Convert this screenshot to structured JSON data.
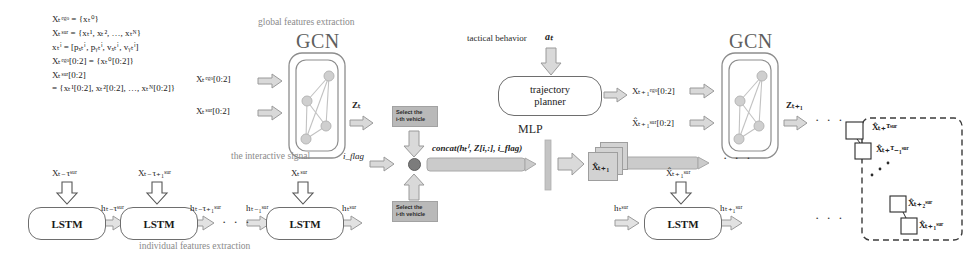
{
  "figure": {
    "type": "neural-network-architecture-diagram"
  },
  "equations": {
    "line1": "Xₜᵉᵍᵒ = {xₜ⁰}",
    "line2": "Xₜˢᵘʳ = {xₜ¹, xₜ², …, xₜᴺ}",
    "line3": "xₜⁱ = [pₓₜⁱ, pᵧₜⁱ, vₓₜⁱ, vᵧₜⁱ]",
    "line4": "Xₜᵉᵍᵒ[0:2] = {xₜ⁰[0:2]}",
    "line5": "Xₜˢᵘʳ[0:2]",
    "line6": "= {xₜ¹[0:2], xₜ²[0:2], …, xₜᴺ[0:2]}"
  },
  "labels": {
    "global_features": "global features extraction",
    "individual_features": "individual features extraction",
    "interactive_signal": "the interactive signal",
    "tactical_behavior": "tactical behavior",
    "gcn_left": "GCN",
    "gcn_right": "GCN",
    "mlp": "MLP",
    "planner_line1": "trajectory",
    "planner_line2": "planner",
    "lstm": "LSTM",
    "select_line1": "Select the",
    "select_line2": "i-th vehicle",
    "ellipsis": "· · ·"
  },
  "symbols": {
    "input_ego_slice": "Xₜᵉᵍᵒ[0:2]",
    "input_sur_slice": "Xₜˢᵘʳ[0:2]",
    "z_t": "Zₜ",
    "z_t1": "Zₜ₊₁",
    "i_flag": "i_flag",
    "concat": "concat(hₜⁱ, Z[i,:], i_flag)",
    "action": "aₜ",
    "out_ego_next": "Xₜ₊₁ᵉᵍᵒ[0:2]",
    "out_sur_next": "X̂ₜ₊₁ˢᵘʳ[0:2]",
    "card_label": "X̂ₜ₊₁",
    "x_sur_next": "X̂ₜ₊₁ˢᵘʳ",
    "h_sur_t": "hₜˢᵘʳ",
    "h_sur_t1": "hₜ₊₁ˢᵘʳ",
    "h_sur_tau": "hₜ₋τˢᵘʳ",
    "h_sur_tau1": "hₜ₋τ₊₁ˢᵘʳ",
    "h_sur_tm1": "hₜ₋₁ˢᵘʳ",
    "x_sur_tau": "Xₜ₋τˢᵘʳ",
    "x_sur_tau1": "Xₜ₋τ₊₁ˢᵘʳ",
    "x_sur_t": "Xₜˢᵘʳ",
    "pred_T": "X̂ₜ₊ᵀˢᵘʳ",
    "pred_T1": "X̂ₜ₊ᵀ₋₁ˢᵘʳ",
    "pred_2": "X̂ₜ₊₂ˢᵘʳ",
    "pred_1": "X̂ₜ₊₁ˢᵘʳ"
  },
  "colors": {
    "arrow_fill": "#d9d9d9",
    "arrow_stroke": "#9a9a9a",
    "select_box": "#b9b9b9",
    "caption_gray": "#8a8a8a",
    "gcn_gray": "#5f5f5f",
    "stroke": "#6e6e6e"
  }
}
